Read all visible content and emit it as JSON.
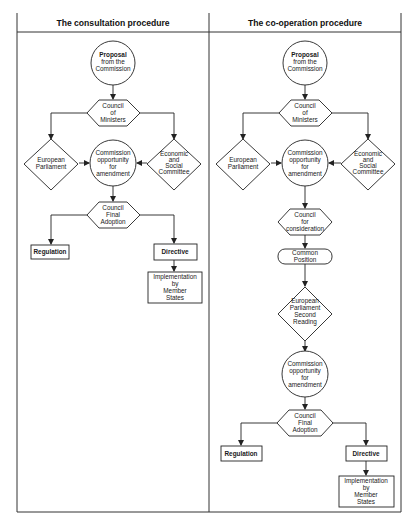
{
  "panels": [
    {
      "title": "The consultation procedure",
      "nodes": {
        "proposal": {
          "lines": [
            "Proposal",
            "from the",
            "Commission"
          ],
          "shape": "circle"
        },
        "council_ministers": {
          "lines": [
            "Council",
            "of",
            "Ministers"
          ],
          "shape": "hexagon"
        },
        "european_parliament": {
          "lines": [
            "European",
            "Parliament"
          ],
          "shape": "diamond"
        },
        "economic_social": {
          "lines": [
            "Economic",
            "and",
            "Social",
            "Committee"
          ],
          "shape": "diamond"
        },
        "commission_amend": {
          "lines": [
            "Commission",
            "opportunity",
            "for",
            "amendment"
          ],
          "shape": "circle"
        },
        "council_final": {
          "lines": [
            "Council",
            "Final",
            "Adoption"
          ],
          "shape": "hexagon"
        },
        "regulation": {
          "lines": [
            "Regulation"
          ],
          "shape": "rect"
        },
        "directive": {
          "lines": [
            "Directive"
          ],
          "shape": "rect"
        },
        "implementation": {
          "lines": [
            "Implementation",
            "by",
            "Member",
            "States"
          ],
          "shape": "rect"
        }
      }
    },
    {
      "title": "The co-operation procedure",
      "nodes": {
        "proposal": {
          "lines": [
            "Proposal",
            "from the",
            "Commission"
          ],
          "shape": "circle"
        },
        "council_ministers": {
          "lines": [
            "Council",
            "of",
            "Ministers"
          ],
          "shape": "hexagon"
        },
        "european_parliament": {
          "lines": [
            "European",
            "Parliament"
          ],
          "shape": "diamond"
        },
        "economic_social": {
          "lines": [
            "Economic",
            "and",
            "Social",
            "Committee"
          ],
          "shape": "diamond"
        },
        "commission_amend": {
          "lines": [
            "Commission",
            "opportunity",
            "for",
            "amendment"
          ],
          "shape": "circle"
        },
        "council_consideration": {
          "lines": [
            "Council",
            "for",
            "consideration"
          ],
          "shape": "hexagon"
        },
        "common_position": {
          "lines": [
            "Common",
            "Position"
          ],
          "shape": "rounded-rect"
        },
        "ep_second_reading": {
          "lines": [
            "European",
            "Parliament",
            "Second",
            "Reading"
          ],
          "shape": "diamond"
        },
        "commission_amend2": {
          "lines": [
            "Commission",
            "opportunity",
            "for",
            "amendment"
          ],
          "shape": "circle"
        },
        "council_final": {
          "lines": [
            "Council",
            "Final",
            "Adoption"
          ],
          "shape": "hexagon"
        },
        "regulation": {
          "lines": [
            "Regulation"
          ],
          "shape": "rect"
        },
        "directive": {
          "lines": [
            "Directive"
          ],
          "shape": "rect"
        },
        "implementation": {
          "lines": [
            "Implementation",
            "by",
            "Member",
            "States"
          ],
          "shape": "rect"
        }
      }
    }
  ]
}
